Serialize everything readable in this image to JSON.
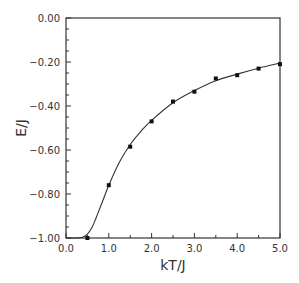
{
  "chart_data": {
    "type": "line",
    "title": "",
    "xlabel": "kT/J",
    "ylabel": "E/J",
    "xlim": [
      0.0,
      5.0
    ],
    "ylim": [
      -1.0,
      0.0
    ],
    "grid": false,
    "legend": null,
    "x_ticks": [
      "0.0",
      "1.0",
      "2.0",
      "3.0",
      "4.0",
      "5.0"
    ],
    "y_ticks": [
      "0.00",
      "-0.20",
      "-0.40",
      "-0.60",
      "-0.80",
      "-1.00"
    ],
    "series": [
      {
        "name": "theory",
        "style": "line",
        "x": [
          0.0,
          0.2,
          0.3,
          0.4,
          0.5,
          0.6,
          0.7,
          0.8,
          0.9,
          1.0,
          1.25,
          1.5,
          1.75,
          2.0,
          2.5,
          3.0,
          3.5,
          4.0,
          4.5,
          5.0
        ],
        "values": [
          -1.0,
          -1.0,
          -0.999,
          -0.995,
          -0.982,
          -0.955,
          -0.91,
          -0.86,
          -0.81,
          -0.76,
          -0.655,
          -0.575,
          -0.515,
          -0.465,
          -0.385,
          -0.33,
          -0.285,
          -0.255,
          -0.228,
          -0.205
        ]
      },
      {
        "name": "simulation",
        "style": "markers",
        "x": [
          0.5,
          1.0,
          1.5,
          2.0,
          2.5,
          3.0,
          3.5,
          4.0,
          4.5,
          5.0
        ],
        "values": [
          -1.0,
          -0.76,
          -0.585,
          -0.47,
          -0.38,
          -0.335,
          -0.275,
          -0.26,
          -0.23,
          -0.21
        ]
      }
    ]
  }
}
